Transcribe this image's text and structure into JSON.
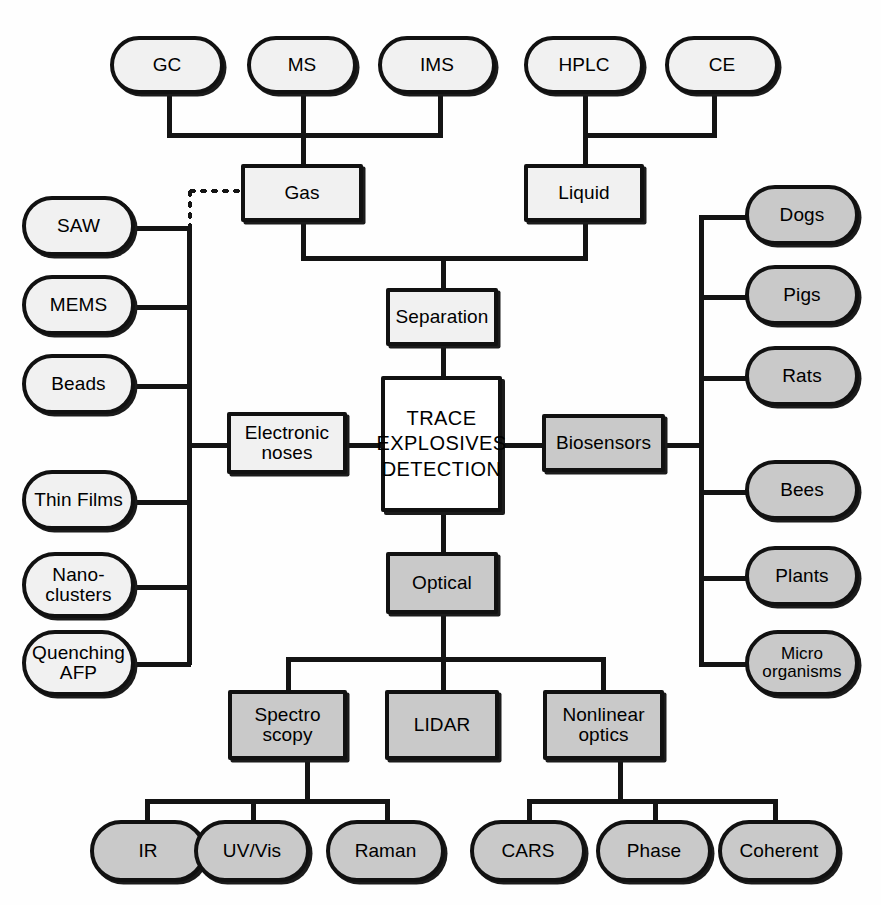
{
  "diagram": {
    "center_node": "TRACE\nEXPLOSIVES\nDETECTION",
    "colors": {
      "stroke": "#141414",
      "fill_light": "#f1f1f1",
      "fill_grey": "#c9c9c9",
      "fill_white": "#ffffff",
      "background": "#fefefe"
    },
    "branches": {
      "separation": {
        "label": "Separation",
        "children": [
          {
            "label": "Gas",
            "techniques": [
              {
                "label": "GC"
              },
              {
                "label": "MS"
              },
              {
                "label": "IMS"
              }
            ]
          },
          {
            "label": "Liquid",
            "techniques": [
              {
                "label": "HPLC"
              },
              {
                "label": "CE"
              }
            ]
          }
        ]
      },
      "electronic_noses": {
        "label": "Electronic\nnoses",
        "children": [
          {
            "label": "SAW"
          },
          {
            "label": "MEMS"
          },
          {
            "label": "Beads"
          },
          {
            "label": "Thin Films"
          },
          {
            "label": "Nano-\nclusters"
          },
          {
            "label": "Quenching\nAFP"
          }
        ]
      },
      "biosensors": {
        "label": "Biosensors",
        "children": [
          {
            "label": "Dogs"
          },
          {
            "label": "Pigs"
          },
          {
            "label": "Rats"
          },
          {
            "label": "Bees"
          },
          {
            "label": "Plants"
          },
          {
            "label": "Micro\norganisms"
          }
        ]
      },
      "optical": {
        "label": "Optical",
        "children": [
          {
            "label": "Spectro\nscopy",
            "children": [
              {
                "label": "IR"
              },
              {
                "label": "UV/Vis"
              },
              {
                "label": "Raman"
              }
            ]
          },
          {
            "label": "LIDAR",
            "children": []
          },
          {
            "label": "Nonlinear\noptics",
            "children": [
              {
                "label": "CARS"
              },
              {
                "label": "Phase"
              },
              {
                "label": "Coherent"
              }
            ]
          }
        ]
      }
    },
    "dotted_link": {
      "from": "SAW bus",
      "to": "Gas"
    }
  }
}
